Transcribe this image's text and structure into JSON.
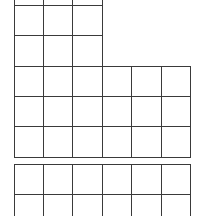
{
  "colors": {
    "line": "#3a3a3a",
    "background": "#ffffff"
  },
  "grids": [
    {
      "name": "upper-grid",
      "narrow_part": {
        "cols_x": [
          14,
          43,
          72,
          102
        ],
        "rows_y": [
          -20,
          5,
          35,
          66
        ]
      },
      "wide_part": {
        "cols_x": [
          14,
          43,
          72,
          102,
          131,
          161,
          190
        ],
        "rows_y": [
          66,
          96,
          126,
          157
        ]
      }
    },
    {
      "name": "lower-grid",
      "cols_x": [
        14,
        43,
        72,
        102,
        131,
        161,
        190
      ],
      "rows_y": [
        164,
        194,
        230
      ]
    }
  ]
}
